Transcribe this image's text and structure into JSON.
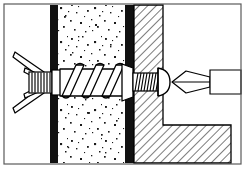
{
  "figure": {
    "title": "Cross-section: expansion wall anchor with screw and screwdriver",
    "width": 245,
    "height": 171,
    "background_color": "#ffffff",
    "frame": {
      "label": "illustration border",
      "stroke_color": "#5a5a5a",
      "stroke_width": 1.2,
      "x": 4,
      "y": 4,
      "width": 237,
      "height": 160
    },
    "line_color": "#000000",
    "fill_color": "#ffffff"
  },
  "layers": [
    {
      "id": "render-left",
      "label": "Left render / plaster skin",
      "pattern": "solid-black",
      "color": "#111111",
      "x": 50,
      "y": 5,
      "width": 8,
      "height": 158
    },
    {
      "id": "core-block",
      "label": "Aerated concrete block core",
      "pattern": "stipple",
      "color": "#ffffff",
      "speckle_color": "#1a1a1a",
      "x": 58,
      "y": 5,
      "width": 67,
      "height": 158
    },
    {
      "id": "render-right",
      "label": "Right render / plaster skin",
      "pattern": "solid-black",
      "color": "#111111",
      "x": 125,
      "y": 5,
      "width": 9,
      "height": 158
    },
    {
      "id": "bracket-section",
      "label": "Steel angle bracket section",
      "pattern": "diagonal-hatch",
      "color": "#ffffff",
      "hatch_color": "#1a1a1a",
      "hatch_angle_deg": 45,
      "hatch_spacing": 6
    },
    {
      "id": "open-air",
      "label": "Open space / air",
      "pattern": "none",
      "color": "#ffffff"
    }
  ],
  "bracket": {
    "label": "L-profile angle bracket",
    "vertical_leg": {
      "x": 134,
      "y": 5,
      "width": 29,
      "height": 158
    },
    "horizontal_leg": {
      "x": 134,
      "y": 125,
      "width": 97,
      "height": 38
    }
  },
  "components": [
    {
      "id": "anchor-tip",
      "label": "Expanded anchor wings (V-shaped toggle)",
      "note": "Two splayed legs opening to the left behind the wall",
      "interactable": false
    },
    {
      "id": "anchor-neck",
      "label": "Knurled anchor neck",
      "note": "Short ribbed shank between the wings and the collar",
      "interactable": false
    },
    {
      "id": "screw-thread-coarse",
      "label": "Coarse helical screw thread in block core",
      "turns": 3,
      "interactable": false
    },
    {
      "id": "screw-thread-fine",
      "label": "Fine machine thread through bracket leg",
      "turns": 9,
      "interactable": false
    },
    {
      "id": "screw-collar",
      "label": "Anchor collar flange",
      "interactable": false
    },
    {
      "id": "screw-head",
      "label": "Pan screw head",
      "interactable": false
    },
    {
      "id": "driver-bit",
      "label": "Pointed screwdriver bit",
      "interactable": false
    },
    {
      "id": "driver-shaft",
      "label": "Screwdriver shaft",
      "interactable": false
    }
  ],
  "geometry": {
    "axis_y": 82,
    "screw_top": 64,
    "screw_bottom": 100,
    "driver_tip_x": 172,
    "driver_shaft_right": 241
  }
}
